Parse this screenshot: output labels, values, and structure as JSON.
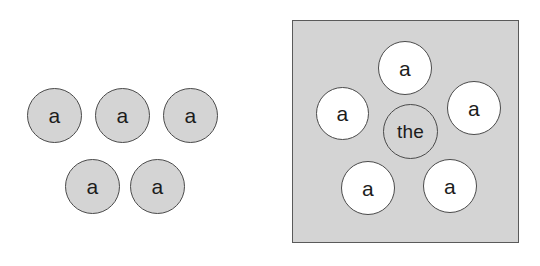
{
  "figure": {
    "width": 540,
    "height": 266,
    "background_color": "#ffffff",
    "node_fill_gray": "#d4d4d4",
    "node_fill_white": "#ffffff",
    "node_stroke_color": "#4a4a4a",
    "backdrop_fill_color": "#d4d4d4",
    "backdrop_stroke_color": "#5a5a5a",
    "label_color": "#1c1c1c"
  },
  "panels": [
    {
      "name": "left-group",
      "has_backdrop": false,
      "node_count": 5,
      "node_fill": "gray",
      "nodes": [
        {
          "label": "a",
          "fill": "gray",
          "x": 27,
          "y": 88,
          "d": 55
        },
        {
          "label": "a",
          "fill": "gray",
          "x": 95,
          "y": 88,
          "d": 55
        },
        {
          "label": "a",
          "fill": "gray",
          "x": 163,
          "y": 88,
          "d": 55
        },
        {
          "label": "a",
          "fill": "gray",
          "x": 65,
          "y": 159,
          "d": 55
        },
        {
          "label": "a",
          "fill": "gray",
          "x": 130,
          "y": 159,
          "d": 55
        }
      ]
    },
    {
      "name": "right-group",
      "has_backdrop": true,
      "node_count": 6,
      "node_fill": "white",
      "backdrop": {
        "x": 292,
        "y": 20,
        "w": 227,
        "h": 223
      },
      "nodes": [
        {
          "label": "a",
          "fill": "white",
          "x": 378,
          "y": 41,
          "d": 54
        },
        {
          "label": "a",
          "fill": "white",
          "x": 316,
          "y": 87,
          "d": 53
        },
        {
          "label": "a",
          "fill": "white",
          "x": 447,
          "y": 81,
          "d": 54
        },
        {
          "label": "the",
          "fill": "gray",
          "x": 383,
          "y": 104,
          "d": 55
        },
        {
          "label": "a",
          "fill": "white",
          "x": 341,
          "y": 161,
          "d": 54
        },
        {
          "label": "a",
          "fill": "white",
          "x": 423,
          "y": 159,
          "d": 54
        }
      ]
    }
  ],
  "labels": {
    "token_a": "a",
    "token_the": "the"
  }
}
